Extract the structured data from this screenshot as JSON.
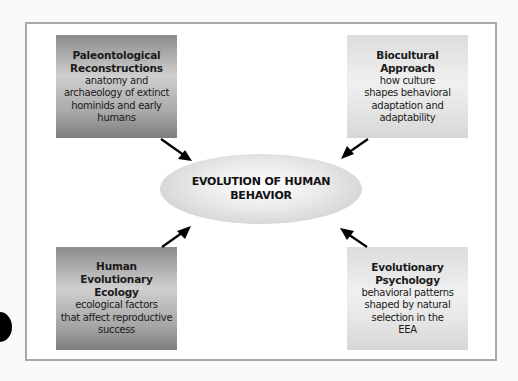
{
  "diagram": {
    "center": {
      "line1": "EVOLUTION OF HUMAN",
      "line2": "BEHAVIOR"
    },
    "boxes": [
      {
        "position": "top-left",
        "title_line1": "Paleontological",
        "title_line2": "Reconstructions",
        "desc_line1": "anatomy and",
        "desc_line2": "archaeology of extinct",
        "desc_line3": "hominids and early",
        "desc_line4": "humans",
        "shade": "dark"
      },
      {
        "position": "top-right",
        "title_line1": "Biocultural",
        "title_line2": "Approach",
        "desc_line1": "how culture",
        "desc_line2": "shapes behavioral",
        "desc_line3": "adaptation and",
        "desc_line4": "adaptability",
        "shade": "light"
      },
      {
        "position": "bottom-left",
        "title_line1": "Human",
        "title_line2": "Evolutionary",
        "title_line3": "Ecology",
        "desc_line1": "ecological factors",
        "desc_line2": "that affect reproductive",
        "desc_line3": "success",
        "shade": "dark"
      },
      {
        "position": "bottom-right",
        "title_line1": "Evolutionary",
        "title_line2": "Psychology",
        "desc_line1": "behavioral patterns",
        "desc_line2": "shaped by natural",
        "desc_line3": "selection in the",
        "desc_line4": "EEA",
        "shade": "light"
      }
    ],
    "arrows": [
      {
        "from": "top-left",
        "to": "center"
      },
      {
        "from": "top-right",
        "to": "center"
      },
      {
        "from": "bottom-left",
        "to": "center"
      },
      {
        "from": "bottom-right",
        "to": "center"
      }
    ],
    "colors": {
      "frame_border": "#a9a9a9",
      "dark_box": "#8c8c8c",
      "light_box": "#e4e4e4",
      "arrow": "#000000"
    }
  }
}
